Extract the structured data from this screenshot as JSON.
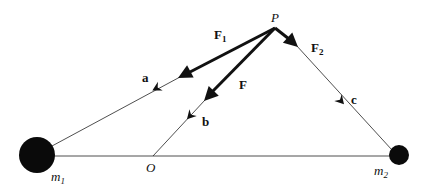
{
  "diagram": {
    "colors": {
      "ink": "#111111",
      "background": "#ffffff"
    },
    "points": {
      "P": {
        "label": "P"
      },
      "O": {
        "label": "O"
      },
      "m1": {
        "label": "m",
        "subscript": "1"
      },
      "m2": {
        "label": "m",
        "subscript": "2"
      }
    },
    "forces": [
      {
        "id": "F1",
        "label": "F",
        "subscript": "1"
      },
      {
        "id": "F",
        "label": "F",
        "subscript": ""
      },
      {
        "id": "F2",
        "label": "F",
        "subscript": "2"
      }
    ],
    "vectors": [
      {
        "id": "a",
        "label": "a"
      },
      {
        "id": "b",
        "label": "b"
      },
      {
        "id": "c",
        "label": "c"
      }
    ]
  }
}
